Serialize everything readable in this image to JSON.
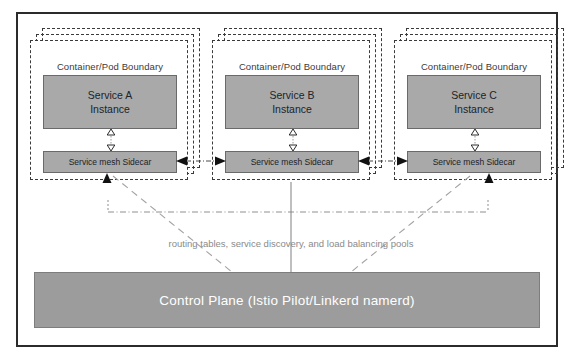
{
  "diagram": {
    "colors": {
      "frame_border": "#2b2b2b",
      "pod_dash": "#3a3a3a",
      "service_box_fill": "#a9a9a9",
      "service_box_border": "#6a6a6a",
      "sidecar_fill": "#a9a9a9",
      "control_plane_fill": "#9c9c9c",
      "control_plane_text": "#ffffff",
      "caption_text": "#8a8a8a",
      "connector": "#9a9a9a",
      "arrow_fill": "#111111",
      "background": "#ffffff"
    },
    "pods": [
      {
        "id": "pod-a",
        "boundary_label": "Container/Pod Boundary",
        "service_name": "Service A",
        "service_kind": "Instance",
        "sidecar_label": "Service mesh Sidecar"
      },
      {
        "id": "pod-b",
        "boundary_label": "Container/Pod Boundary",
        "service_name": "Service B",
        "service_kind": "Instance",
        "sidecar_label": "Service mesh Sidecar"
      },
      {
        "id": "pod-c",
        "boundary_label": "Container/Pod Boundary",
        "service_name": "Service C",
        "service_kind": "Instance",
        "sidecar_label": "Service mesh Sidecar"
      }
    ],
    "mesh_caption": "routing tables, service discovery, and load balancing pools",
    "control_plane": {
      "label": "Control Plane (Istio Pilot/Linkerd namerd)"
    },
    "connections": {
      "service_to_sidecar": "bidirectional-hollow-arrow",
      "sidecar_to_sidecar": "bidirectional-dash-dot-arrow",
      "sidecar_to_control_plane": "dashed-line"
    }
  }
}
